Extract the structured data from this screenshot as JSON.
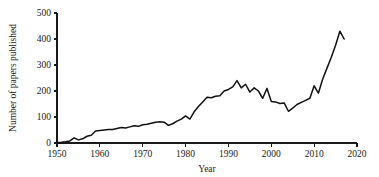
{
  "chart_data": {
    "type": "line",
    "title": "",
    "xlabel": "Year",
    "ylabel": "Number of papers published",
    "xlim": [
      1950,
      2020
    ],
    "ylim": [
      0,
      500
    ],
    "xticks": [
      1950,
      1960,
      1970,
      1980,
      1990,
      2000,
      2010,
      2020
    ],
    "xtick_labels": [
      "1950",
      "1960",
      "1970",
      "1980",
      "1990",
      "2000",
      "2010",
      "2020"
    ],
    "yticks": [
      0,
      100,
      200,
      300,
      400,
      500
    ],
    "ytick_labels": [
      "0",
      "100",
      "200",
      "300",
      "400",
      "500"
    ],
    "grid": false,
    "legend": false,
    "line_color": "#111111",
    "series": [
      {
        "name": "Papers published",
        "x": [
          1950,
          1951,
          1952,
          1953,
          1954,
          1955,
          1956,
          1957,
          1958,
          1959,
          1960,
          1961,
          1962,
          1963,
          1964,
          1965,
          1966,
          1967,
          1968,
          1969,
          1970,
          1971,
          1972,
          1973,
          1974,
          1975,
          1976,
          1977,
          1978,
          1979,
          1980,
          1981,
          1982,
          1983,
          1984,
          1985,
          1986,
          1987,
          1988,
          1989,
          1990,
          1991,
          1992,
          1993,
          1994,
          1995,
          1996,
          1997,
          1998,
          1999,
          2000,
          2001,
          2002,
          2003,
          2004,
          2005,
          2006,
          2007,
          2008,
          2009,
          2010,
          2011,
          2012,
          2013,
          2014,
          2015,
          2016,
          2017
        ],
        "values": [
          2,
          3,
          5,
          8,
          20,
          12,
          16,
          26,
          30,
          46,
          48,
          50,
          52,
          52,
          56,
          60,
          58,
          62,
          66,
          64,
          70,
          72,
          76,
          80,
          82,
          80,
          68,
          74,
          84,
          92,
          104,
          92,
          120,
          140,
          158,
          176,
          174,
          180,
          182,
          200,
          206,
          216,
          240,
          212,
          226,
          196,
          212,
          200,
          172,
          210,
          160,
          158,
          152,
          154,
          122,
          134,
          148,
          156,
          164,
          172,
          220,
          192,
          246,
          288,
          330,
          376,
          430,
          400
        ]
      }
    ]
  },
  "axes": {
    "y_axis_label": "Number of papers published",
    "x_axis_label": "Year"
  }
}
